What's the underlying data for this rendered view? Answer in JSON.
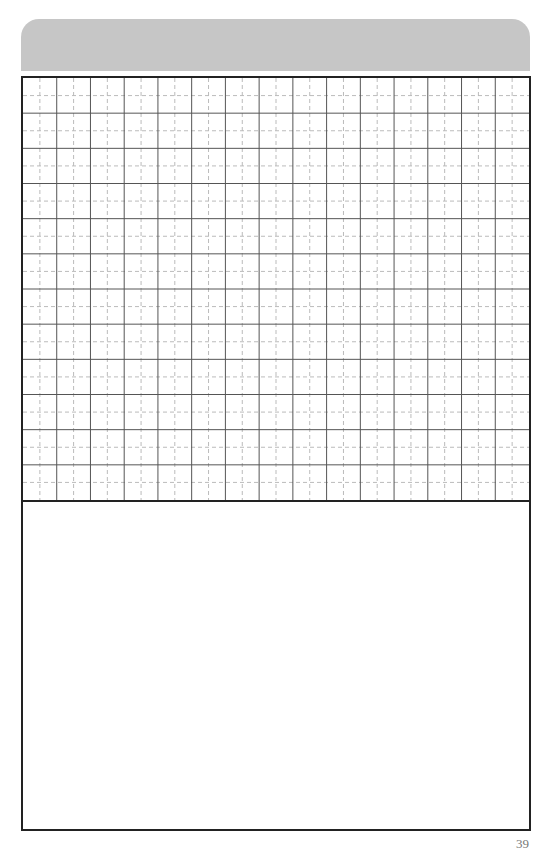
{
  "page": {
    "header_bar_color": "#c6c6c6",
    "border_color": "#222222",
    "page_number": "39"
  },
  "grid": {
    "columns": 15,
    "rows": 12,
    "solid_line_color": "#555555",
    "dashed_line_color": "#bbbbbb"
  }
}
